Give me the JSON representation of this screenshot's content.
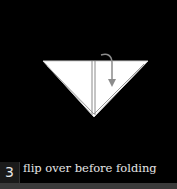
{
  "step": {
    "number": "3",
    "caption": "flip over before folding"
  },
  "diagram": {
    "shape": "inverted-triangle",
    "fill": "#ffffff",
    "background": "#000000",
    "fold_line": "vertical-center",
    "arrow": "flip-over-arrow",
    "arrow_color": "#888888"
  }
}
